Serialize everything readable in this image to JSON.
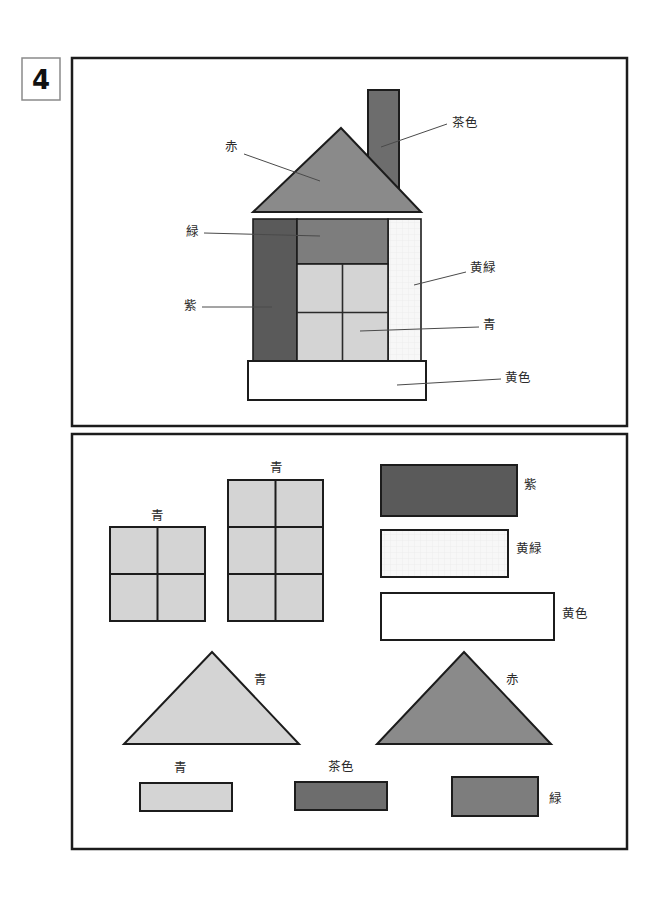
{
  "worksheet": {
    "number_label": "4",
    "title": "Shape composition worksheet"
  },
  "palette": {
    "red": "#8a8a8a",
    "brown": "#6d6d6d",
    "green": "#7d7d7d",
    "purple": "#5a5a5a",
    "blue": "#d4d4d4",
    "yellow_green": "#f7f7f7",
    "yellow": "#ffffff",
    "outline": "#1c1c1c",
    "leader_line": "#4a4a4a",
    "text": "#2b2b2b"
  },
  "color_names": {
    "red": "赤",
    "brown": "茶色",
    "green": "緑",
    "purple": "紫",
    "blue": "青",
    "yellow_green": "黄緑",
    "yellow": "黄色"
  },
  "top_panel": {
    "name": "house-assembly-panel",
    "parts": [
      {
        "id": "roof",
        "shape": "triangle",
        "color_key": "red",
        "label": "赤"
      },
      {
        "id": "chimney",
        "shape": "rectangle",
        "color_key": "brown",
        "label": "茶色"
      },
      {
        "id": "upper-wall",
        "shape": "rectangle",
        "color_key": "green",
        "label": "緑"
      },
      {
        "id": "left-wall",
        "shape": "rectangle",
        "color_key": "purple",
        "label": "紫"
      },
      {
        "id": "right-wall",
        "shape": "rectangle",
        "color_key": "yellow_green",
        "label": "黄緑"
      },
      {
        "id": "windows",
        "shape": "grid",
        "color_key": "blue",
        "label": "青"
      },
      {
        "id": "base",
        "shape": "rectangle",
        "color_key": "yellow",
        "label": "黄色"
      }
    ],
    "labels": [
      {
        "text": "赤",
        "x": 231,
        "y": 151,
        "anchor": "middle"
      },
      {
        "text": "茶色",
        "x": 452,
        "y": 127,
        "anchor": "start"
      },
      {
        "text": "緑",
        "x": 192,
        "y": 236,
        "anchor": "middle"
      },
      {
        "text": "紫",
        "x": 190,
        "y": 310,
        "anchor": "middle"
      },
      {
        "text": "黄緑",
        "x": 470,
        "y": 272,
        "anchor": "start"
      },
      {
        "text": "青",
        "x": 483,
        "y": 329,
        "anchor": "start"
      },
      {
        "text": "黄色",
        "x": 505,
        "y": 382,
        "anchor": "start"
      }
    ]
  },
  "bottom_panel": {
    "name": "parts-library-panel",
    "items": [
      {
        "id": "window-2x2-small",
        "type": "window-grid",
        "label": "青",
        "color_key": "blue",
        "rows": 2,
        "cols": 2
      },
      {
        "id": "window-2x3-tall",
        "type": "window-grid",
        "label": "青",
        "color_key": "blue",
        "rows": 3,
        "cols": 2
      },
      {
        "id": "rect-purple",
        "type": "rectangle",
        "label": "紫",
        "color_key": "purple"
      },
      {
        "id": "rect-yellowgreen",
        "type": "rectangle",
        "label": "黄緑",
        "color_key": "yellow_green"
      },
      {
        "id": "rect-yellow",
        "type": "rectangle",
        "label": "黄色",
        "color_key": "yellow"
      },
      {
        "id": "triangle-blue",
        "type": "triangle",
        "label": "青",
        "color_key": "blue"
      },
      {
        "id": "triangle-red",
        "type": "triangle",
        "label": "赤",
        "color_key": "red"
      },
      {
        "id": "rect-blue-small",
        "type": "rectangle",
        "label": "青",
        "color_key": "blue"
      },
      {
        "id": "rect-brown-small",
        "type": "rectangle",
        "label": "茶色",
        "color_key": "brown"
      },
      {
        "id": "rect-green-small",
        "type": "rectangle",
        "label": "緑",
        "color_key": "green"
      }
    ],
    "labels": [
      {
        "text": "青",
        "x": 157,
        "y": 520,
        "anchor": "middle"
      },
      {
        "text": "青",
        "x": 276,
        "y": 472,
        "anchor": "middle"
      },
      {
        "text": "紫",
        "x": 524,
        "y": 489,
        "anchor": "start"
      },
      {
        "text": "黄緑",
        "x": 516,
        "y": 553,
        "anchor": "start"
      },
      {
        "text": "黄色",
        "x": 562,
        "y": 618,
        "anchor": "start"
      },
      {
        "text": "青",
        "x": 254,
        "y": 684,
        "anchor": "start"
      },
      {
        "text": "赤",
        "x": 506,
        "y": 684,
        "anchor": "start"
      },
      {
        "text": "青",
        "x": 180,
        "y": 772,
        "anchor": "middle"
      },
      {
        "text": "茶色",
        "x": 341,
        "y": 771,
        "anchor": "middle"
      },
      {
        "text": "緑",
        "x": 549,
        "y": 803,
        "anchor": "start"
      }
    ]
  }
}
